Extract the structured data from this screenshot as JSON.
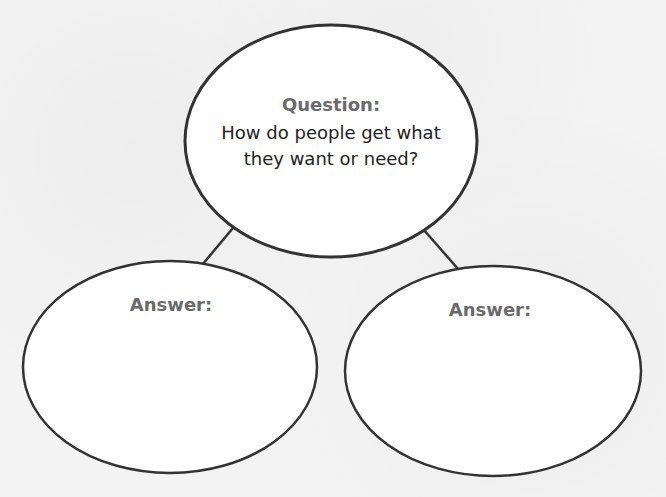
{
  "diagram": {
    "question_node": {
      "heading": "Question:",
      "line1": "How do people get what",
      "line2": "they want or need?"
    },
    "answer_nodes": [
      {
        "heading": "Answer:",
        "content": ""
      },
      {
        "heading": "Answer:",
        "content": ""
      }
    ],
    "colors": {
      "background": "#f3f3f3",
      "ellipse_fill": "#ffffff",
      "stroke": "#333333",
      "heading": "#6a6a6a",
      "text": "#222222"
    }
  }
}
